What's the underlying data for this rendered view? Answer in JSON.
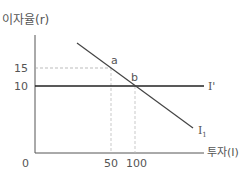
{
  "diagram": {
    "y_axis_label": "이자율(r)",
    "x_axis_label": "투자(I)",
    "origin_label": "0",
    "y_ticks": [
      {
        "label": "15",
        "value": 15
      },
      {
        "label": "10",
        "value": 10
      }
    ],
    "x_ticks": [
      {
        "label": "50",
        "value": 50
      },
      {
        "label": "100",
        "value": 100
      }
    ],
    "curves": [
      {
        "name": "I1",
        "label_base": "I",
        "label_sub": "1",
        "type": "downward-sloping investment demand"
      },
      {
        "name": "I'",
        "label": "I'",
        "type": "horizontal line at r=10"
      }
    ],
    "points": [
      {
        "label": "a",
        "x": 50,
        "y": 15
      },
      {
        "label": "b",
        "x": 100,
        "y": 10
      }
    ],
    "colors": {
      "axis": "#555555",
      "curve": "#444444",
      "horizontal_line": "#222222",
      "dashed": "#aaaaaa"
    }
  }
}
